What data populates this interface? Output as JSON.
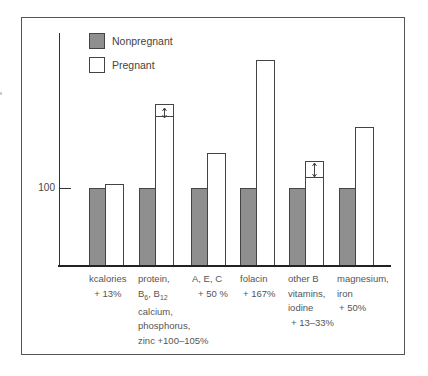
{
  "chart_data": {
    "type": "bar",
    "title": "",
    "xlabel": "",
    "ylabel": "",
    "y_reference": 100,
    "y_tick_labels": [
      "100"
    ],
    "legend": [
      {
        "name": "Nonpregnant",
        "color": "#8f8f8f"
      },
      {
        "name": "Pregnant",
        "color": "#ffffff"
      }
    ],
    "legend_position": "top-left inside",
    "grid": false,
    "categories": [
      "kcalories + 13%",
      "protein, B6, B12 calcium, phosphorus, zinc +100-105%",
      "A, E, C + 50%",
      "folacin + 167%",
      "other B vitamins, iodine + 13-33%",
      "magnesium, iron + 50%"
    ],
    "series": [
      {
        "name": "Nonpregnant",
        "values": [
          100,
          100,
          100,
          100,
          100,
          100
        ]
      },
      {
        "name": "Pregnant",
        "values": [
          113,
          200,
          150,
          267,
          113,
          150
        ],
        "range_top": [
          null,
          205,
          null,
          null,
          133,
          null
        ]
      }
    ],
    "bar_px": {
      "base_y": 266,
      "ref_y": 188,
      "np": [
        {
          "x": 89,
          "top": 188
        },
        {
          "x": 139,
          "top": 188
        },
        {
          "x": 191,
          "top": 188
        },
        {
          "x": 240,
          "top": 188
        },
        {
          "x": 289,
          "top": 188
        },
        {
          "x": 339,
          "top": 188
        }
      ],
      "p": [
        {
          "x": 106,
          "top": 184
        },
        {
          "x": 156,
          "top": 116
        },
        {
          "x": 208,
          "top": 153
        },
        {
          "x": 257,
          "top": 60
        },
        {
          "x": 306,
          "top": 177
        },
        {
          "x": 356,
          "top": 127
        }
      ],
      "ranges": [
        {
          "x": 156,
          "top": 104,
          "bottom": 116
        },
        {
          "x": 306,
          "top": 161,
          "bottom": 177
        }
      ]
    }
  },
  "legend": {
    "nonpregnant": "Nonpregnant",
    "pregnant": "Pregnant"
  },
  "axis": {
    "tick_100": "100"
  },
  "labels": {
    "kcal": [
      "kcalories",
      "+ 13%"
    ],
    "protein_l1": "protein,",
    "protein_b": "B",
    "protein_b6": "6",
    "protein_sep": ", B",
    "protein_b12": "12",
    "protein_l3": "calcium,",
    "protein_l4": "phosphorus,",
    "protein_l5": "zinc +100–105%",
    "aec": [
      "A, E, C",
      "+ 50 %"
    ],
    "folacin": [
      "folacin",
      "+ 167%"
    ],
    "otherb": [
      "other B",
      "vitamins,",
      "iodine",
      "+ 13–33%"
    ],
    "magnesium": [
      "magnesium,",
      "iron",
      "+ 50%"
    ]
  }
}
